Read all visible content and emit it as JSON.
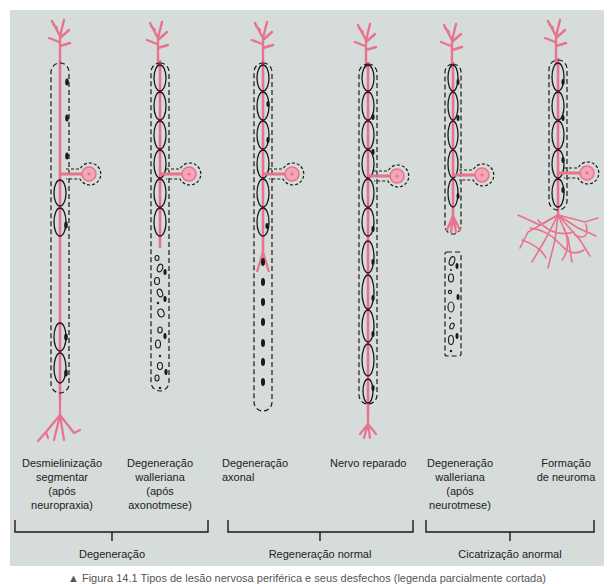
{
  "colors": {
    "background_panel": "#d5dcda",
    "axon": "#e8738f",
    "axon_fill": "#f3a6b6",
    "sheath": "#1a1a1a",
    "text": "#222222"
  },
  "columns": [
    {
      "id": "c1",
      "label": "Desmielinização\nsegmentar\n(após\nneuropraxia)",
      "axon_x": 60
    },
    {
      "id": "c2",
      "label": "Degeneração\nwalleriana\n(após\naxonotmese)",
      "axon_x": 160
    },
    {
      "id": "c3",
      "label": "Degeneração\naxonal",
      "axon_x": 263
    },
    {
      "id": "c4",
      "label": "Nervo reparado",
      "axon_x": 368
    },
    {
      "id": "c5",
      "label": "Degeneração\nwalleriana\n(após\nneurotmese)",
      "axon_x": 453
    },
    {
      "id": "c6",
      "label": "Formação\nde neuroma",
      "axon_x": 558
    }
  ],
  "groups": [
    {
      "label": "Degeneração",
      "x_start": 15,
      "x_end": 208,
      "stem_x": 112
    },
    {
      "label": "Regeneração normal",
      "x_start": 228,
      "x_end": 413,
      "stem_x": 320
    },
    {
      "label": "Cicatrização anormal",
      "x_start": 426,
      "x_end": 594,
      "stem_x": 510
    }
  ],
  "caption": "▲ Figura 14.1  Tipos de lesão nervosa periférica e seus desfechos (legenda parcialmente cortada)"
}
